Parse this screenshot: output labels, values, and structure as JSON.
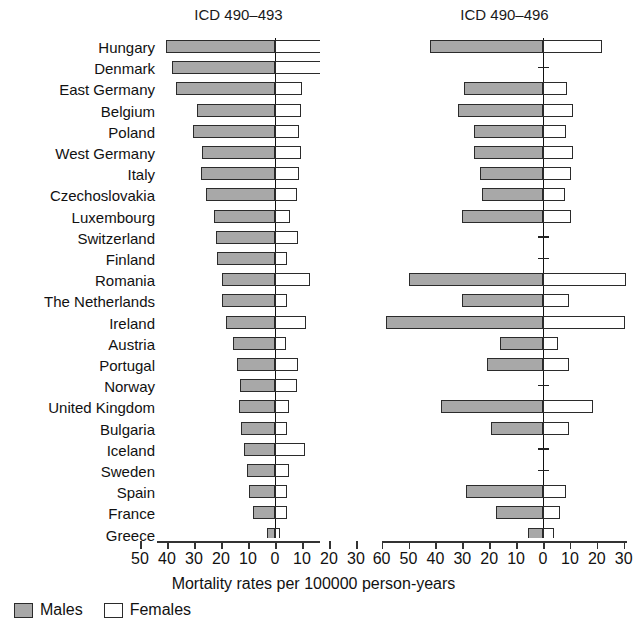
{
  "chart_data": {
    "type": "bar",
    "subtype": "grouped horizontal bidirectional (paired back-to-back), two panels",
    "title": "",
    "xlabel": "Mortality rates per 100000 person-years",
    "ylabel": "",
    "grid": false,
    "legend_position": "bottom-left",
    "legend": [
      "Males",
      "Females"
    ],
    "colors": {
      "males": "#a8a8a8",
      "females": "#ffffff",
      "outline": "#2b2b2b",
      "axis": "#333333"
    },
    "note": "Left bars extend leftward from 0 (Males); right bars extend rightward from 0 (Females). Blank rows with a short tick mark indicate no data available.",
    "panels": [
      {
        "name": "panel-left",
        "title": "ICD 490–493",
        "xlim": [
          -50,
          30
        ],
        "xticks": [
          -50,
          -40,
          -30,
          -20,
          -10,
          0,
          10,
          20,
          30
        ],
        "xticklabels": [
          "50",
          "40",
          "30",
          "20",
          "10",
          "0",
          "10",
          "20",
          "30"
        ]
      },
      {
        "name": "panel-right",
        "title": "ICD 490–496",
        "xlim": [
          -60,
          30
        ],
        "xticks": [
          -60,
          -50,
          -40,
          -30,
          -20,
          -10,
          0,
          10,
          20,
          30
        ],
        "xticklabels": [
          "60",
          "50",
          "40",
          "30",
          "20",
          "10",
          "0",
          "10",
          "20",
          "30"
        ]
      }
    ],
    "categories": [
      "Hungary",
      "Denmark",
      "East Germany",
      "Belgium",
      "Poland",
      "West Germany",
      "Italy",
      "Czechoslovakia",
      "Luxembourg",
      "Switzerland",
      "Finland",
      "Romania",
      "The Netherlands",
      "Ireland",
      "Austria",
      "Portugal",
      "Norway",
      "United Kingdom",
      "Bulgaria",
      "Iceland",
      "Sweden",
      "Spain",
      "France",
      "Greece"
    ],
    "series": [
      {
        "name": "Males",
        "panel": "ICD 490-493",
        "direction": "left",
        "values": [
          40.5,
          38.0,
          36.5,
          29.0,
          30.5,
          27.0,
          27.5,
          25.5,
          22.5,
          22.0,
          21.5,
          19.5,
          19.5,
          18.0,
          15.5,
          14.0,
          13.0,
          13.5,
          12.5,
          11.5,
          10.5,
          9.5,
          8.0,
          3.0
        ]
      },
      {
        "name": "Females",
        "panel": "ICD 490-493",
        "direction": "right",
        "values": [
          17.0,
          20.5,
          10.0,
          9.5,
          9.0,
          9.5,
          9.0,
          8.0,
          5.5,
          8.5,
          4.5,
          13.0,
          4.5,
          11.5,
          4.0,
          8.5,
          8.0,
          5.0,
          4.5,
          11.0,
          5.0,
          4.5,
          4.5,
          2.0
        ]
      },
      {
        "name": "Males",
        "panel": "ICD 490-496",
        "direction": "left",
        "values": [
          42.0,
          null,
          29.5,
          31.5,
          25.5,
          25.5,
          23.5,
          22.5,
          30.0,
          null,
          null,
          50.0,
          30.0,
          58.5,
          16.0,
          21.0,
          null,
          38.0,
          19.5,
          null,
          null,
          28.5,
          17.5,
          5.5
        ]
      },
      {
        "name": "Females",
        "panel": "ICD 490-496",
        "direction": "right",
        "values": [
          22.0,
          null,
          9.0,
          11.0,
          8.5,
          11.0,
          10.5,
          8.0,
          10.5,
          null,
          null,
          31.0,
          9.5,
          30.5,
          5.5,
          9.5,
          null,
          18.5,
          9.5,
          null,
          null,
          8.5,
          6.5,
          4.0
        ]
      }
    ],
    "no_data_categories_panel_right": [
      "Denmark",
      "Switzerland",
      "Finland",
      "Norway",
      "Iceland",
      "Sweden"
    ]
  },
  "axis": {
    "title": "Mortality rates per 100000 person-years"
  },
  "legend": {
    "males_label": "Males",
    "females_label": "Females"
  }
}
